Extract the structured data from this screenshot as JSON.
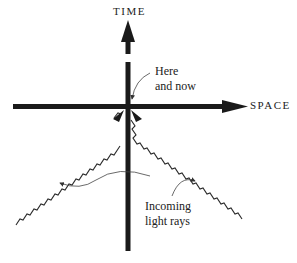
{
  "diagram": {
    "axes": {
      "time_label": "TIME",
      "space_label": "SPACE"
    },
    "annotations": {
      "origin_line1": "Here",
      "origin_line2": "and now",
      "rays_line1": "Incoming",
      "rays_line2": "light rays"
    },
    "colors": {
      "axis": "#1a1a1a",
      "ray": "#2a2a2a",
      "leader": "#444444"
    }
  }
}
